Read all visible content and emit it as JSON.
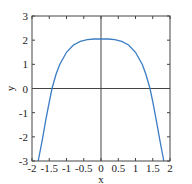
{
  "chart_data": {
    "type": "line",
    "title": "",
    "xlabel": "x",
    "ylabel": "y",
    "xlim": [
      -2,
      2
    ],
    "ylim": [
      -3,
      3
    ],
    "xticks": [
      "-2",
      "-1.5",
      "-1",
      "-0.5",
      "0",
      "0.5",
      "1",
      "1.5",
      "2"
    ],
    "yticks": [
      "-3",
      "-2",
      "-1",
      "0",
      "1",
      "2",
      "3"
    ],
    "grid": false,
    "axes_lines": {
      "x0": true,
      "y0": true
    },
    "series": [
      {
        "name": "y",
        "color": "#3a7cc4",
        "x": [
          -1.82,
          -1.7,
          -1.6,
          -1.5,
          -1.42,
          -1.3,
          -1.2,
          -1.0,
          -0.8,
          -0.6,
          -0.4,
          -0.2,
          0,
          0.2,
          0.4,
          0.6,
          0.8,
          1.0,
          1.2,
          1.3,
          1.42,
          1.5,
          1.6,
          1.7,
          1.82
        ],
        "y": [
          -3.0,
          -2.1,
          -1.3,
          -0.55,
          0.0,
          0.6,
          0.98,
          1.5,
          1.8,
          1.95,
          2.02,
          2.05,
          2.05,
          2.05,
          2.02,
          1.95,
          1.8,
          1.5,
          0.98,
          0.6,
          0.0,
          -0.55,
          -1.3,
          -2.1,
          -3.0
        ]
      }
    ]
  }
}
